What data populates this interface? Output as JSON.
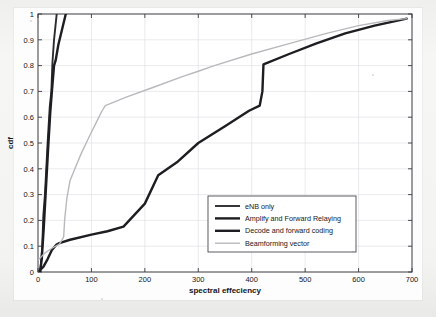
{
  "figure": {
    "kind": "cdf-plot",
    "background_color": "#fdfdfd",
    "page_color": "#f2f2f1",
    "axis_color": "#3a3a40",
    "grid_color": "#dcdce0"
  },
  "axes": {
    "x": {
      "label": "spectral effeciency",
      "min": 0,
      "max": 700,
      "ticks": [
        0,
        100,
        200,
        300,
        400,
        500,
        600,
        700
      ],
      "tick_labels": [
        "0",
        "100",
        "200",
        "300",
        "400",
        "500",
        "600",
        "700"
      ]
    },
    "y": {
      "label": "cdf",
      "min": 0,
      "max": 1,
      "ticks": [
        0,
        0.1,
        0.2,
        0.3,
        0.4,
        0.5,
        0.6,
        0.7,
        0.8,
        0.9,
        1
      ],
      "tick_labels": [
        "0",
        "0.1",
        "0.2",
        "0.3",
        "0.4",
        "0.5",
        "0.6",
        "0.7",
        "0.8",
        "0.9",
        "1"
      ]
    }
  },
  "legend": {
    "position": "center-right-lower",
    "border_color": "#4a4a50",
    "background": "#ffffff",
    "entries": [
      {
        "label": "eNB only",
        "color": "#2b2b30",
        "width": 1.9
      },
      {
        "label": "Amplify and Forward Relaying",
        "color": "#1d1d22",
        "width": 2.4
      },
      {
        "label": "Decode and forward coding",
        "color": "#1d1d22",
        "width": 2.4
      },
      {
        "label": "Beamforming vector",
        "color": "#b9b9bd",
        "width": 1.4
      }
    ]
  },
  "chart_data": {
    "type": "line",
    "title": "",
    "xlabel": "spectral effeciency",
    "ylabel": "cdf",
    "xlim": [
      0,
      700
    ],
    "ylim": [
      0,
      1
    ],
    "grid": true,
    "legend_position": "center-right-lower",
    "series": [
      {
        "name": "eNB only",
        "color": "#2b2b30",
        "width": 1.9,
        "points": [
          [
            3,
            0.0
          ],
          [
            5,
            0.02
          ],
          [
            8,
            0.1
          ],
          [
            10,
            0.22
          ],
          [
            13,
            0.3
          ],
          [
            18,
            0.5
          ],
          [
            22,
            0.64
          ],
          [
            25,
            0.7
          ],
          [
            27,
            0.81
          ],
          [
            30,
            0.9
          ],
          [
            33,
            0.96
          ],
          [
            35,
            1.0
          ]
        ]
      },
      {
        "name": "Amplify and Forward Relaying",
        "color": "#1d1d22",
        "width": 2.4,
        "points": [
          [
            4,
            0.0
          ],
          [
            7,
            0.05
          ],
          [
            11,
            0.18
          ],
          [
            15,
            0.33
          ],
          [
            19,
            0.48
          ],
          [
            23,
            0.62
          ],
          [
            26,
            0.7
          ],
          [
            30,
            0.8
          ],
          [
            33,
            0.82
          ],
          [
            38,
            0.88
          ],
          [
            45,
            0.94
          ],
          [
            52,
            1.0
          ]
        ]
      },
      {
        "name": "Decode and forward coding",
        "color": "#1d1d22",
        "width": 2.4,
        "points": [
          [
            3,
            0.005
          ],
          [
            6,
            0.012
          ],
          [
            10,
            0.02
          ],
          [
            18,
            0.05
          ],
          [
            26,
            0.085
          ],
          [
            34,
            0.105
          ],
          [
            40,
            0.112
          ],
          [
            60,
            0.125
          ],
          [
            100,
            0.145
          ],
          [
            130,
            0.158
          ],
          [
            160,
            0.176
          ],
          [
            200,
            0.265
          ],
          [
            225,
            0.375
          ],
          [
            260,
            0.425
          ],
          [
            300,
            0.5
          ],
          [
            350,
            0.565
          ],
          [
            395,
            0.625
          ],
          [
            415,
            0.645
          ],
          [
            420,
            0.7
          ],
          [
            422,
            0.805
          ],
          [
            470,
            0.845
          ],
          [
            520,
            0.885
          ],
          [
            575,
            0.925
          ],
          [
            630,
            0.955
          ],
          [
            690,
            0.982
          ]
        ]
      },
      {
        "name": "Beamforming vector",
        "color": "#b9b9bd",
        "width": 1.4,
        "points": [
          [
            1,
            0.048
          ],
          [
            12,
            0.072
          ],
          [
            26,
            0.092
          ],
          [
            40,
            0.108
          ],
          [
            48,
            0.135
          ],
          [
            50,
            0.205
          ],
          [
            54,
            0.285
          ],
          [
            60,
            0.355
          ],
          [
            66,
            0.385
          ],
          [
            80,
            0.455
          ],
          [
            96,
            0.525
          ],
          [
            108,
            0.575
          ],
          [
            120,
            0.625
          ],
          [
            126,
            0.645
          ],
          [
            165,
            0.678
          ],
          [
            215,
            0.715
          ],
          [
            270,
            0.757
          ],
          [
            300,
            0.778
          ],
          [
            330,
            0.8
          ],
          [
            400,
            0.845
          ],
          [
            470,
            0.885
          ],
          [
            540,
            0.925
          ],
          [
            600,
            0.955
          ],
          [
            655,
            0.975
          ],
          [
            690,
            0.982
          ]
        ]
      }
    ]
  }
}
